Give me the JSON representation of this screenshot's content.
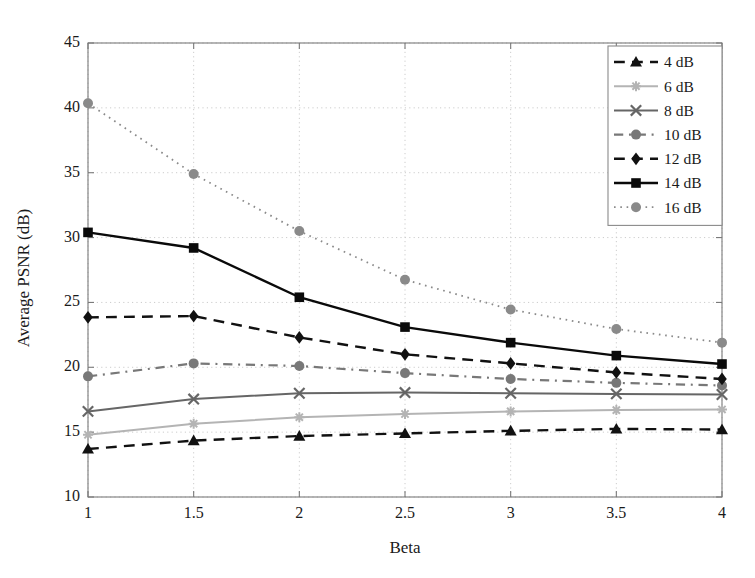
{
  "chart_data": {
    "type": "line",
    "title": "",
    "xlabel": "Beta",
    "ylabel": "Average PSNR (dB)",
    "x": [
      1,
      1.5,
      2,
      2.5,
      3,
      3.5,
      4
    ],
    "xtick_labels": [
      "1",
      "1.5",
      "2",
      "2.5",
      "3",
      "3.5",
      "4"
    ],
    "ytick_labels": [
      "10",
      "15",
      "20",
      "25",
      "30",
      "35",
      "40",
      "45"
    ],
    "xlim": [
      1,
      4
    ],
    "ylim": [
      10,
      45
    ],
    "grid": true,
    "legend_position": "top-right",
    "series": [
      {
        "name": "4 dB",
        "values": [
          13.7,
          14.35,
          14.7,
          14.9,
          15.1,
          15.25,
          15.2
        ],
        "color": "#111111",
        "marker": "triangle",
        "linestyle": "dashed",
        "linewidth": 2.4
      },
      {
        "name": "6 dB",
        "values": [
          14.8,
          15.65,
          16.15,
          16.4,
          16.6,
          16.7,
          16.75
        ],
        "color": "#b4b4b4",
        "marker": "star",
        "linestyle": "solid",
        "linewidth": 2.0
      },
      {
        "name": "8 dB",
        "values": [
          16.6,
          17.55,
          18.0,
          18.05,
          18.0,
          17.95,
          17.9
        ],
        "color": "#666666",
        "marker": "x",
        "linestyle": "solid",
        "linewidth": 2.0
      },
      {
        "name": "10 dB",
        "values": [
          19.3,
          20.3,
          20.1,
          19.55,
          19.1,
          18.8,
          18.6
        ],
        "color": "#787878",
        "marker": "circle",
        "linestyle": "dashdot",
        "linewidth": 2.2
      },
      {
        "name": "12 dB",
        "values": [
          23.85,
          23.95,
          22.3,
          21.0,
          20.3,
          19.6,
          19.1
        ],
        "color": "#111111",
        "marker": "diamond",
        "linestyle": "dashed",
        "linewidth": 2.4
      },
      {
        "name": "14 dB",
        "values": [
          30.4,
          29.2,
          25.4,
          23.1,
          21.9,
          20.9,
          20.25
        ],
        "color": "#0a0a0a",
        "marker": "square",
        "linestyle": "solid",
        "linewidth": 2.4
      },
      {
        "name": "16 dB",
        "values": [
          40.35,
          34.9,
          30.5,
          26.75,
          24.45,
          22.95,
          21.9
        ],
        "color": "#8a8a8a",
        "marker": "circle",
        "linestyle": "dotted",
        "linewidth": 1.8
      }
    ]
  },
  "legend": {
    "entries": [
      "4 dB",
      "6 dB",
      "8 dB",
      "10 dB",
      "12 dB",
      "14 dB",
      "16 dB"
    ]
  },
  "colors": {
    "axis": "#7a7a7a",
    "grid": "#cccccc",
    "text": "#1a1a1a",
    "background": "#ffffff"
  }
}
